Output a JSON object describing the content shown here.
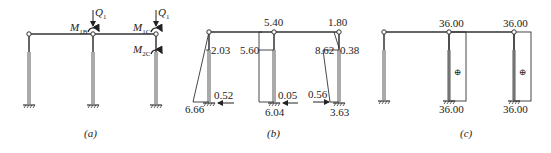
{
  "panels": [
    {
      "id": "a",
      "caption": "(a)",
      "loads": {
        "Q_left": "Q",
        "Q_left_sub": "1",
        "Q_right": "Q",
        "Q_right_sub": "1",
        "M_B": "M",
        "M_B_sub": "1B",
        "M_1C": "M",
        "M_1C_sub": "1C",
        "M_2C": "M",
        "M_2C_sub": "2C"
      }
    },
    {
      "id": "b",
      "caption": "(b)",
      "values": {
        "top_mid": "5.40",
        "top_right": "1.80",
        "left_upper": "2.03",
        "mid_upper": "5.60",
        "right_upper_left": "8.62",
        "right_upper_right": "0.38",
        "left_base": "6.66",
        "left_shear": "0.52",
        "mid_shear": "0.05",
        "mid_base": "6.04",
        "right_shear": "0.56",
        "right_base": "3.63"
      }
    },
    {
      "id": "c",
      "caption": "(c)",
      "values": {
        "top_mid": "36.00",
        "top_right": "36.00",
        "base_mid": "36.00",
        "base_right": "36.00",
        "sign_mid": "⊕",
        "sign_right": "⊕"
      }
    }
  ],
  "colors": {
    "line": "#333333",
    "column": "#aaaaaa"
  }
}
